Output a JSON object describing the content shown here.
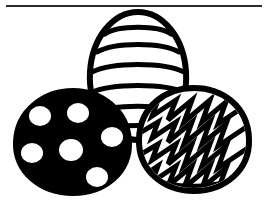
{
  "page": {
    "background_color": "#ffffff",
    "width": 267,
    "height": 214
  },
  "divider": {
    "name": "top-horizontal-rule",
    "color": "#2b2b2b",
    "x": 6,
    "y": 5,
    "width": 256,
    "thickness": 2
  },
  "artwork": {
    "description": "Black and white coloring-page clip art of three decorated Easter eggs",
    "stroke_color": "#000000",
    "fill_color": "#ffffff",
    "eggs": [
      {
        "id": "striped-egg",
        "label": "Striped Easter Egg",
        "position": "top center",
        "fill": "#ffffff",
        "outline": "#000000",
        "pattern": "horizontal-stripes",
        "stripe_count": 6,
        "center_x": 138,
        "center_y": 78,
        "radius_x": 48,
        "radius_y": 66
      },
      {
        "id": "polka-dot-egg",
        "label": "Black Polka Dot Easter Egg",
        "position": "left",
        "fill": "#000000",
        "outline": "#000000",
        "pattern": "polka-dots",
        "dot_count": 6,
        "dot_color": "#ffffff",
        "center_x": 73,
        "center_y": 142,
        "radius_x": 58,
        "radius_y": 52
      },
      {
        "id": "zigzag-egg",
        "label": "Zigzag Easter Egg",
        "position": "right",
        "fill": "#ffffff",
        "outline": "#000000",
        "pattern": "zigzag-chevron",
        "zigzag_rows": 4,
        "center_x": 194,
        "center_y": 140,
        "radius_x": 56,
        "radius_y": 52
      }
    ]
  }
}
